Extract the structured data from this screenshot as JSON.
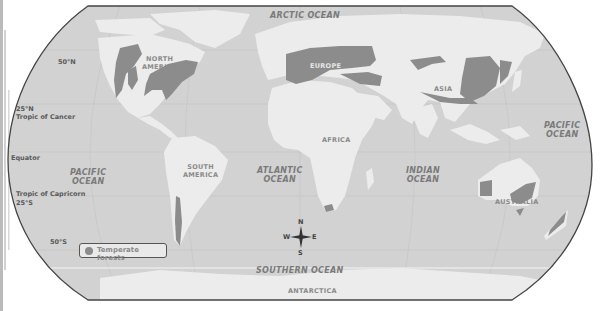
{
  "map": {
    "title": "Temperate forests of the world",
    "projection": "Robinson-like world map, grayscale",
    "colors": {
      "ocean": "#d2d2d2",
      "land": "#ececec",
      "temperate_forest": "#8c8c8c",
      "border": "#444444",
      "background": "#ffffff"
    },
    "oceans": {
      "arctic": "ARCTIC OCEAN",
      "pacific_west_line1": "PACIFIC",
      "pacific_west_line2": "OCEAN",
      "atlantic_line1": "ATLANTIC",
      "atlantic_line2": "OCEAN",
      "indian_line1": "INDIAN",
      "indian_line2": "OCEAN",
      "pacific_east_line1": "PACIFIC",
      "pacific_east_line2": "OCEAN",
      "southern": "SOUTHERN OCEAN"
    },
    "continents": {
      "north_america_line1": "NORTH",
      "north_america_line2": "AMERICA",
      "south_america_line1": "SOUTH",
      "south_america_line2": "AMERICA",
      "europe": "EUROPE",
      "africa": "AFRICA",
      "asia": "ASIA",
      "australia": "AUSTRALIA",
      "antarctica": "ANTARCTICA"
    },
    "latitudes": {
      "lat50n": "50°N",
      "lat25n": "25°N",
      "tropic_cancer": "Tropic of Cancer",
      "equator": "Equator",
      "tropic_capricorn": "Tropic of Capricorn",
      "lat25s": "25°S",
      "lat50s": "50°S"
    },
    "compass": {
      "n": "N",
      "s": "S",
      "e": "E",
      "w": "W"
    },
    "legend": {
      "items": [
        {
          "label": "Temperate forests",
          "color": "#8c8c8c"
        }
      ]
    }
  }
}
